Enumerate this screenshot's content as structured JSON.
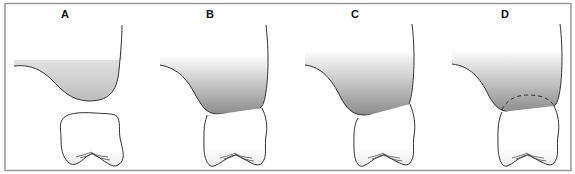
{
  "figure": {
    "type": "dental diagram",
    "border_color": "#9a9a9a",
    "tissue_gradient": {
      "top": "#ffffff",
      "bottom": "#8e8e8e"
    },
    "panels": [
      {
        "label": "A",
        "description": "Soft tissue separated from tooth crown"
      },
      {
        "label": "B",
        "description": "Soft tissue contacting tooth crown along a double line"
      },
      {
        "label": "C",
        "description": "Soft tissue resting on tooth crown"
      },
      {
        "label": "D",
        "description": "Soft tissue overlapping tooth crown with dashed outline of hidden crown"
      }
    ]
  }
}
